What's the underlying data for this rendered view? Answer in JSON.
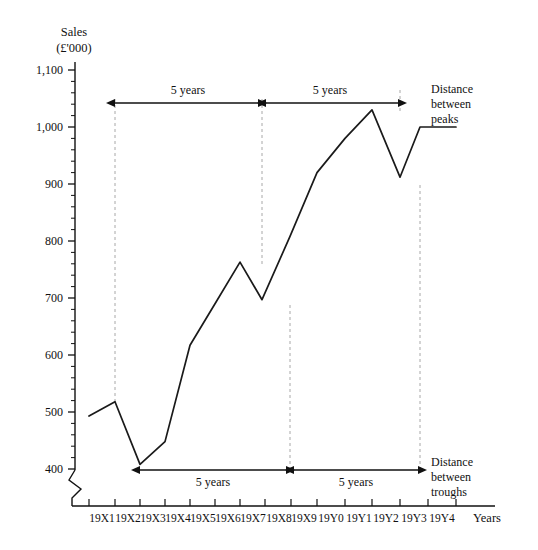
{
  "chart_data": {
    "type": "line",
    "title": "Sales (£'000)",
    "title_lines": [
      "Sales",
      "(£'000)"
    ],
    "xlabel": "Years",
    "ylabel": "Sales (£'000)",
    "categories": [
      "19X1",
      "19X2",
      "19X3",
      "19X4",
      "19X5",
      "19X6",
      "19X7",
      "19X8",
      "19X9",
      "19Y0",
      "19Y1",
      "19Y2",
      "19Y3",
      "19Y4"
    ],
    "values": [
      493,
      518,
      408,
      448,
      617,
      690,
      763,
      697,
      808,
      920,
      980,
      1030,
      912,
      1000
    ],
    "series": [
      {
        "name": "Sales",
        "values": [
          493,
          518,
          408,
          448,
          617,
          690,
          763,
          697,
          808,
          920,
          980,
          1030,
          912,
          1000
        ]
      }
    ],
    "ylim": [
      380,
      1130
    ],
    "y_ticks": [
      400,
      500,
      600,
      700,
      800,
      900,
      1000,
      1100
    ],
    "y_tick_labels": [
      "400",
      "500",
      "600",
      "700",
      "800",
      "900",
      "1,000",
      "1,100"
    ],
    "y_minor_step": 20,
    "axis_break": true,
    "grid": false,
    "legend": "none",
    "line_color": "#1a1a1a",
    "guide_color": "#aaaaaa",
    "annotations": [
      {
        "id": "top-span-1",
        "label": "5 years",
        "from": "19X2",
        "to": "19X7",
        "type": "double-arrow",
        "position": "top"
      },
      {
        "id": "top-span-2",
        "label": "5 years",
        "from": "19X7",
        "to": "19Y2",
        "type": "double-arrow",
        "position": "top"
      },
      {
        "id": "top-note",
        "label": "Distance between peaks",
        "lines": [
          "Distance",
          "between",
          "peaks"
        ],
        "position": "top-right"
      },
      {
        "id": "bottom-span-1",
        "label": "5 years",
        "from": "19X3",
        "to": "19X8",
        "type": "double-arrow",
        "position": "bottom"
      },
      {
        "id": "bottom-span-2",
        "label": "5 years",
        "from": "19X8",
        "to": "19Y3",
        "type": "double-arrow",
        "position": "bottom"
      },
      {
        "id": "bottom-note",
        "label": "Distance between troughs",
        "lines": [
          "Distance",
          "between",
          "troughs"
        ],
        "position": "bottom-right"
      }
    ],
    "peaks": [
      "19X2",
      "19X7",
      "19Y2"
    ],
    "troughs": [
      "19X3",
      "19X8",
      "19Y3"
    ]
  },
  "labels": {
    "title_line1": "Sales",
    "title_line2": "(£'000)",
    "xaxis_label": "Years",
    "ytick_1100": "1,100",
    "ytick_1000": "1,000",
    "ytick_900": "900",
    "ytick_800": "800",
    "ytick_700": "700",
    "ytick_600": "600",
    "ytick_500": "500",
    "ytick_400": "400",
    "xtick_0": "19X1",
    "xtick_1": "19X2",
    "xtick_2": "19X3",
    "xtick_3": "19X4",
    "xtick_4": "19X5",
    "xtick_5": "19X6",
    "xtick_6": "19X7",
    "xtick_7": "19X8",
    "xtick_8": "19X9",
    "xtick_9": "19Y0",
    "xtick_10": "19Y1",
    "xtick_11": "19Y2",
    "xtick_12": "19Y3",
    "xtick_13": "19Y4",
    "span_top_1": "5 years",
    "span_top_2": "5 years",
    "span_bottom_1": "5 years",
    "span_bottom_2": "5 years",
    "peaks_note_1": "Distance",
    "peaks_note_2": "between",
    "peaks_note_3": "peaks",
    "troughs_note_1": "Distance",
    "troughs_note_2": "between",
    "troughs_note_3": "troughs"
  }
}
